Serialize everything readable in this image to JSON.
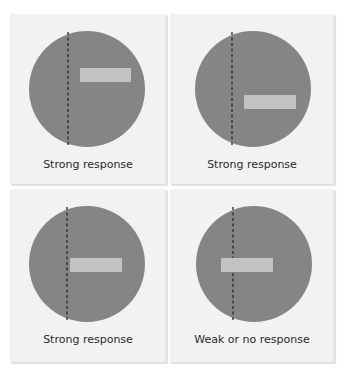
{
  "figure": {
    "colors": {
      "background": "#ffffff",
      "panel": "#f2f2f2",
      "circle": "#858585",
      "bar": "#c2c2c2",
      "dashed_line": "#2a2a2a",
      "text": "#2a2a2a"
    },
    "panels": [
      {
        "id": "top-left",
        "label": "Strong response",
        "circle": {
          "cx": 77,
          "cy": 75,
          "r": 58
        },
        "dashed_line_x": 58,
        "bar": {
          "x": 70,
          "y": 54,
          "w": 51,
          "h": 14
        }
      },
      {
        "id": "top-right",
        "label": "Strong response",
        "circle": {
          "cx": 77,
          "cy": 75,
          "r": 58
        },
        "dashed_line_x": 56,
        "bar": {
          "x": 68,
          "y": 81,
          "w": 52,
          "h": 14
        }
      },
      {
        "id": "bottom-left",
        "label": "Strong response",
        "circle": {
          "cx": 77,
          "cy": 75,
          "r": 58
        },
        "dashed_line_x": 57,
        "bar": {
          "x": 60,
          "y": 69,
          "w": 52,
          "h": 14
        }
      },
      {
        "id": "bottom-right",
        "label": "Weak or no response",
        "circle": {
          "cx": 78,
          "cy": 75,
          "r": 58
        },
        "dashed_line_x": 57,
        "bar": {
          "x": 45,
          "y": 69,
          "w": 52,
          "h": 14
        }
      }
    ]
  }
}
